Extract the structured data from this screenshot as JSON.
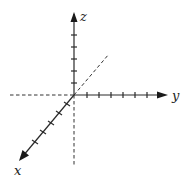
{
  "diagram": {
    "title": "",
    "type": "3d-coordinate-axes",
    "colors": {
      "line": "#2a2a2a",
      "dashed": "#333333",
      "background": "#ffffff"
    },
    "origin": {
      "x": 74,
      "y": 95
    },
    "axes": [
      {
        "name": "z",
        "label": "z",
        "direction": "up",
        "tick_count": 5,
        "dashed_negative": "down"
      },
      {
        "name": "y",
        "label": "y",
        "direction": "right",
        "tick_count": 6,
        "dashed_negative": "left"
      },
      {
        "name": "x",
        "label": "x",
        "direction": "down-left",
        "tick_count": 5,
        "dashed_negative": "up-right"
      }
    ],
    "labels": {
      "z": "z",
      "y": "y",
      "x": "x"
    }
  }
}
